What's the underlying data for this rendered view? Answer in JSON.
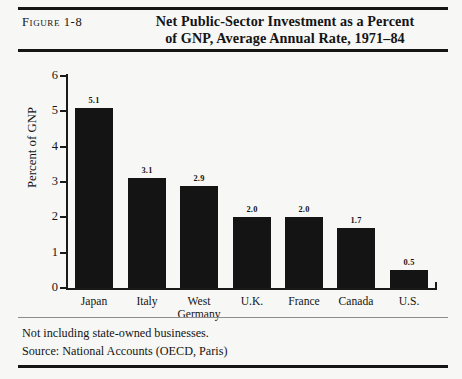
{
  "figure": {
    "label": "Figure 1-8",
    "title_line1": "Net Public-Sector Investment as a Percent",
    "title_line2": "of GNP, Average Annual Rate, 1971–84"
  },
  "notes": {
    "note1": "Not including state-owned businesses.",
    "note2": "Source: National Accounts (OECD, Paris)"
  },
  "colors": {
    "bar": "#141414",
    "axis": "#1a1a1a",
    "background": "#f7f7f5",
    "rule": "#151515",
    "thin_rule": "#8d8d8d"
  },
  "chart_data": {
    "type": "bar",
    "title": "Net Public-Sector Investment as a Percent of GNP, Average Annual Rate, 1971–84",
    "xlabel": "",
    "ylabel": "Percent of GNP",
    "categories": [
      "Japan",
      "Italy",
      "West Germany",
      "U.K.",
      "France",
      "Canada",
      "U.S."
    ],
    "category_lines": [
      [
        "Japan"
      ],
      [
        "Italy"
      ],
      [
        "West",
        "Germany"
      ],
      [
        "U.K."
      ],
      [
        "France"
      ],
      [
        "Canada"
      ],
      [
        "U.S."
      ]
    ],
    "values": [
      5.1,
      3.1,
      2.9,
      2.0,
      2.0,
      1.7,
      0.5
    ],
    "value_labels": [
      "5.1",
      "3.1",
      "2.9",
      "2.0",
      "2.0",
      "1.7",
      "0.5"
    ],
    "ylim": [
      0,
      6
    ],
    "yticks": [
      0,
      1,
      2,
      3,
      4,
      5,
      6
    ],
    "ytick_labels": [
      "0",
      "1",
      "2",
      "3",
      "4",
      "5",
      "6"
    ],
    "grid": false,
    "legend": null
  }
}
